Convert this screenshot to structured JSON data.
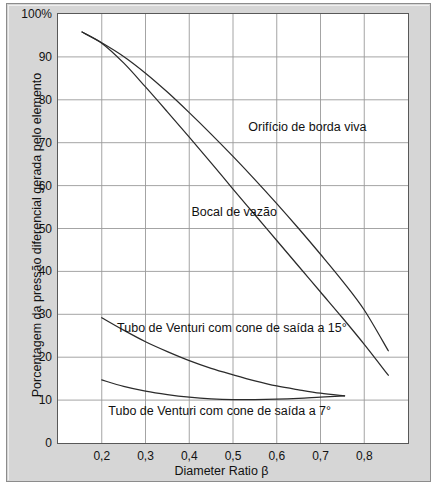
{
  "chart_data": {
    "type": "line",
    "title": "",
    "xlabel": "Diameter Ratio β",
    "ylabel": "Porcentagem da pressão diferencial gerada pelo elemento",
    "xlim": [
      0.1,
      0.9
    ],
    "ylim": [
      0,
      100
    ],
    "xticks": [
      "0,2",
      "0,3",
      "0,4",
      "0,5",
      "0,6",
      "0,7",
      "0,8"
    ],
    "xtick_values": [
      0.2,
      0.3,
      0.4,
      0.5,
      0.6,
      0.7,
      0.8
    ],
    "yticks": [
      "0",
      "10",
      "20",
      "30",
      "40",
      "50",
      "60",
      "70",
      "80",
      "90",
      "100%"
    ],
    "ytick_values": [
      0,
      10,
      20,
      30,
      40,
      50,
      60,
      70,
      80,
      90,
      100
    ],
    "grid": true,
    "legend_position": "inline-annotations",
    "series": [
      {
        "name": "Orifício de borda viva",
        "label": "Orifício de borda viva",
        "label_x": 0.535,
        "label_y": 73.5,
        "x": [
          0.155,
          0.2,
          0.25,
          0.3,
          0.35,
          0.4,
          0.45,
          0.5,
          0.55,
          0.6,
          0.65,
          0.7,
          0.75,
          0.8,
          0.855
        ],
        "y": [
          95.8,
          93.3,
          90.1,
          86.2,
          81.8,
          77.0,
          72.0,
          66.8,
          61.4,
          55.8,
          50.0,
          44.0,
          37.8,
          31.0,
          21.5
        ]
      },
      {
        "name": "Bocal de vazão",
        "label": "Bocal de vazão",
        "label_x": 0.405,
        "label_y": 53.5,
        "x": [
          0.155,
          0.2,
          0.25,
          0.3,
          0.35,
          0.4,
          0.45,
          0.5,
          0.55,
          0.6,
          0.65,
          0.7,
          0.75,
          0.8,
          0.855
        ],
        "y": [
          95.8,
          93.2,
          88.6,
          83.0,
          77.2,
          71.3,
          65.3,
          59.2,
          53.2,
          47.2,
          41.2,
          35.2,
          29.2,
          23.0,
          15.8
        ]
      },
      {
        "name": "Tubo de Venturi com cone de saída a 15°",
        "label": "Tubo de Venturi com cone de saída a 15°",
        "label_x": 0.235,
        "label_y": 26.5,
        "x": [
          0.2,
          0.25,
          0.3,
          0.35,
          0.4,
          0.45,
          0.5,
          0.55,
          0.6,
          0.65,
          0.7,
          0.755
        ],
        "y": [
          29.2,
          26.3,
          23.6,
          21.3,
          19.2,
          17.4,
          15.9,
          14.5,
          13.3,
          12.4,
          11.6,
          11.0
        ]
      },
      {
        "name": "Tubo de Venturi com cone de saída a 7°",
        "label": "Tubo de Venturi com cone de saída a 7°",
        "label_x": 0.215,
        "label_y": 7.2,
        "x": [
          0.2,
          0.25,
          0.3,
          0.35,
          0.4,
          0.45,
          0.5,
          0.55,
          0.6,
          0.65,
          0.7,
          0.755
        ],
        "y": [
          14.7,
          13.2,
          12.1,
          11.3,
          10.7,
          10.3,
          10.1,
          10.1,
          10.2,
          10.4,
          10.7,
          11.0
        ]
      }
    ]
  },
  "axis": {
    "y_axis_title": "Porcentagem da pressão diferencial gerada pelo elemento",
    "x_axis_title": "Diameter Ratio β",
    "y_tick_labels": [
      "100%",
      "90",
      "80",
      "70",
      "60",
      "50",
      "40",
      "30",
      "20",
      "10",
      "0"
    ],
    "x_tick_labels": [
      "0,2",
      "0,3",
      "0,4",
      "0,5",
      "0,6",
      "0,7",
      "0,8"
    ]
  },
  "colors": {
    "plate_background": "#d6d6d6",
    "plot_background": "#ffffff",
    "grid_line": "#9a9a9a",
    "curve_line": "#2b2b2b",
    "frame_border": "#585858",
    "text": "#121212"
  }
}
